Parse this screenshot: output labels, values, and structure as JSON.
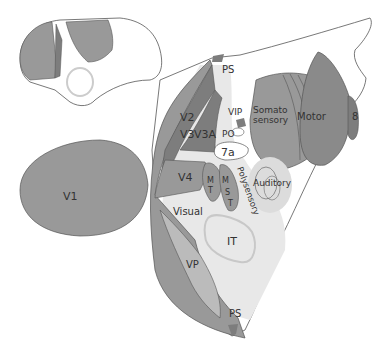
{
  "diagram": {
    "type": "cortical flat map (macaque)",
    "colors": {
      "dark": "#7d7d7d",
      "mid": "#999999",
      "light": "#dcdcdc",
      "pale": "#e8e8e8",
      "outline": "#555555",
      "white": "#ffffff"
    },
    "inset": {
      "name": "lateral brain view"
    },
    "labels": {
      "ps_top": "PS",
      "ps_bottom": "PS",
      "v1": "V1",
      "v2": "V2",
      "v3": "V3",
      "v3a": "V3A",
      "vip": "VIP",
      "po": "PO",
      "a7": "7a",
      "somato1": "Somato",
      "somato2": "sensory",
      "motor": "Motor",
      "area8": "8",
      "v4": "V4",
      "mt1": "M",
      "mt2": "T",
      "mst1": "M",
      "mst2": "S",
      "mst3": "T",
      "polysensory": "Polysensory",
      "auditory": "Auditory",
      "visual": "Visual",
      "it": "IT",
      "vp": "VP"
    }
  }
}
